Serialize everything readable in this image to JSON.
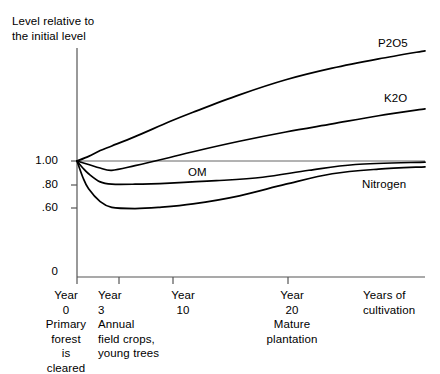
{
  "chart_data": {
    "type": "line",
    "title": "",
    "ylabel": "Level relative to\nthe initial level",
    "xlabel": "Years of\ncultivation",
    "grid": false,
    "legend_position": "inline-right",
    "ylim": [
      0,
      2.05
    ],
    "xlim": [
      0,
      30
    ],
    "y_ticks": [
      {
        "value": 1.0,
        "label": "1.00"
      },
      {
        "value": 0.8,
        "label": ".80"
      },
      {
        "value": 0.6,
        "label": ".60"
      },
      {
        "value": 0.0,
        "label": "0"
      }
    ],
    "x_ticks": [
      {
        "value": 0,
        "label": "Year\n0\nPrimary\nforest\nis\ncleared"
      },
      {
        "value": 3,
        "label": "Year\n3\nAnnual\nfield crops,\nyoung trees"
      },
      {
        "value": 10,
        "label": "Year\n10"
      },
      {
        "value": 20,
        "label": "Year\n20\nMature\nplantation"
      }
    ],
    "reference_line": {
      "value": 1.0,
      "label": "initial level"
    },
    "series": [
      {
        "name": "P2O5",
        "label": "P2O5",
        "x": [
          0,
          1,
          2,
          3,
          5,
          8,
          10,
          14,
          18,
          22,
          26,
          30
        ],
        "values": [
          1.0,
          1.04,
          1.09,
          1.13,
          1.21,
          1.34,
          1.42,
          1.57,
          1.7,
          1.8,
          1.88,
          1.95
        ]
      },
      {
        "name": "K2O",
        "label": "K2O",
        "x": [
          0,
          1,
          2,
          3,
          5,
          8,
          10,
          14,
          18,
          22,
          26,
          30
        ],
        "values": [
          1.0,
          0.97,
          0.94,
          0.92,
          0.96,
          1.03,
          1.08,
          1.17,
          1.25,
          1.32,
          1.39,
          1.45
        ]
      },
      {
        "name": "OM",
        "label": "OM",
        "x": [
          0,
          0.5,
          1,
          2,
          3,
          5,
          8,
          12,
          16,
          20,
          24,
          30
        ],
        "values": [
          1.0,
          0.94,
          0.89,
          0.82,
          0.8,
          0.8,
          0.81,
          0.83,
          0.86,
          0.92,
          0.97,
          0.99
        ]
      },
      {
        "name": "Nitrogen",
        "label": "Nitrogen",
        "x": [
          0,
          0.5,
          1,
          2,
          3,
          5,
          7,
          10,
          14,
          18,
          22,
          26,
          30
        ],
        "values": [
          1.0,
          0.86,
          0.76,
          0.65,
          0.6,
          0.59,
          0.6,
          0.63,
          0.7,
          0.8,
          0.89,
          0.93,
          0.95
        ]
      }
    ]
  },
  "axis": {
    "y_title": "Level relative to\nthe initial level",
    "x_caption": "Years of\ncultivation",
    "ytick_1": "1.00",
    "ytick_2": ".80",
    "ytick_3": ".60",
    "ytick_4": "0"
  },
  "xticks": {
    "t0": "Year\n0\nPrimary\nforest\nis\ncleared",
    "t1": "Year\n3\nAnnual\nfield crops,\nyoung trees",
    "t2": "Year\n10",
    "t3": "Year\n20\nMature\nplantation"
  },
  "series_labels": {
    "p2o5": "P2O5",
    "k2o": "K2O",
    "om": "OM",
    "nitrogen": "Nitrogen"
  },
  "colors": {
    "line": "#000000",
    "axis": "#555555",
    "background": "#ffffff"
  }
}
